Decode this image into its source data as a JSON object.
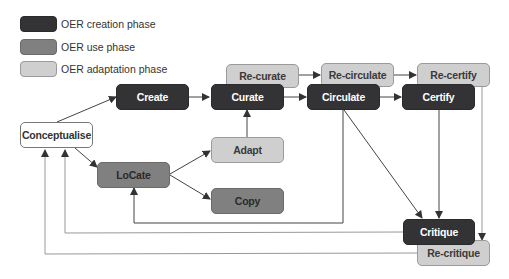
{
  "legend": [
    {
      "label": "OER creation phase",
      "color": "#333335"
    },
    {
      "label": "OER use phase",
      "color": "#808080"
    },
    {
      "label": "OER adaptation phase",
      "color": "#cfcfcf"
    }
  ],
  "nodes": {
    "conceptualise": "Conceptualise",
    "create": "Create",
    "curate": "Curate",
    "circulate": "Circulate",
    "certify": "Certify",
    "critique": "Critique",
    "locate": "LoCate",
    "adapt": "Adapt",
    "copy": "Copy",
    "re_curate": "Re-curate",
    "re_circulate": "Re-circulate",
    "re_certify": "Re-certify",
    "re_critique": "Re-critique"
  },
  "colors": {
    "creation": "#333335",
    "use": "#808080",
    "adaptation": "#cfcfcf",
    "line": "#444444",
    "line_light": "#999999"
  }
}
